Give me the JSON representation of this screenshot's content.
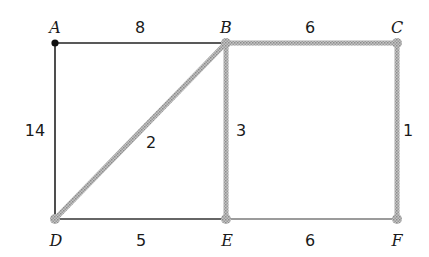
{
  "diagram": {
    "type": "weighted-graph",
    "colors": {
      "normal_edge": "#222222",
      "light_edge": "#7a7a7a",
      "highlight_edge": "#b8b8b8",
      "highlight_edge_dots": "#8c8c8c",
      "start_node": "#111111",
      "highlight_node": "#b0b0b0"
    },
    "nodes": [
      {
        "id": "A",
        "label": "A",
        "x": 55,
        "y": 43,
        "style": "start"
      },
      {
        "id": "B",
        "label": "B",
        "x": 226,
        "y": 43,
        "style": "highlight"
      },
      {
        "id": "C",
        "label": "C",
        "x": 397,
        "y": 43,
        "style": "highlight"
      },
      {
        "id": "D",
        "label": "D",
        "x": 55,
        "y": 219,
        "style": "highlight"
      },
      {
        "id": "E",
        "label": "E",
        "x": 226,
        "y": 219,
        "style": "highlight"
      },
      {
        "id": "F",
        "label": "F",
        "x": 397,
        "y": 219,
        "style": "highlight"
      }
    ],
    "edges": [
      {
        "from": "A",
        "to": "B",
        "weight": "8",
        "style": "normal"
      },
      {
        "from": "A",
        "to": "D",
        "weight": "14",
        "style": "normal"
      },
      {
        "from": "B",
        "to": "C",
        "weight": "6",
        "style": "highlight"
      },
      {
        "from": "B",
        "to": "D",
        "weight": "2",
        "style": "highlight"
      },
      {
        "from": "B",
        "to": "E",
        "weight": "3",
        "style": "highlight"
      },
      {
        "from": "C",
        "to": "F",
        "weight": "1",
        "style": "highlight"
      },
      {
        "from": "D",
        "to": "E",
        "weight": "5",
        "style": "normal"
      },
      {
        "from": "E",
        "to": "F",
        "weight": "6",
        "style": "light"
      }
    ],
    "labels": {
      "A": "A",
      "B": "B",
      "C": "C",
      "D": "D",
      "E": "E",
      "F": "F",
      "w_AB": "8",
      "w_AD": "14",
      "w_BC": "6",
      "w_BD": "2",
      "w_BE": "3",
      "w_CF": "1",
      "w_DE": "5",
      "w_EF": "6"
    }
  }
}
